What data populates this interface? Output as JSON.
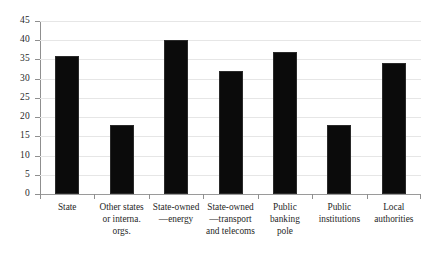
{
  "chart_data": {
    "type": "bar",
    "title": "",
    "subtitle": "",
    "xlabel": "",
    "ylabel": "",
    "ylim": [
      0,
      45
    ],
    "ytick_step": 5,
    "yticks": [
      45,
      40,
      35,
      30,
      25,
      20,
      15,
      10,
      5,
      0
    ],
    "grid": true,
    "legend": null,
    "bar_color": "#0b0b0b",
    "gridline_color": "#e6e6e6",
    "axis_color": "#8f8f8f",
    "background_color": "#ffffff",
    "categories": [
      "State",
      "Other states or interna. orgs.",
      "State-owned —energy",
      "State-owned —transport and telecoms",
      "Public banking pole",
      "Public institutions",
      "Local authorities"
    ],
    "category_lines": [
      [
        "State"
      ],
      [
        "Other states",
        "or interna.",
        "orgs."
      ],
      [
        "State-owned",
        "—energy"
      ],
      [
        "State-owned",
        "—transport",
        "and telecoms"
      ],
      [
        "Public",
        "banking",
        "pole"
      ],
      [
        "Public",
        "institutions"
      ],
      [
        "Local",
        "authorities"
      ]
    ],
    "values": [
      36,
      18,
      40,
      32,
      37,
      18,
      34
    ]
  }
}
